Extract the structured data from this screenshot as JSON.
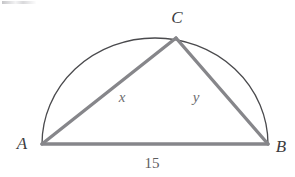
{
  "figure": {
    "kind": "geometry-diagram",
    "background_color": "#ffffff",
    "stroke_colors": {
      "arc": "#4a4a4d",
      "triangle": "#86868a",
      "label": "#58585a"
    },
    "arc": {
      "start": {
        "x": 42,
        "y": 144
      },
      "end": {
        "x": 268,
        "y": 144
      },
      "radius_x": 113,
      "radius_y": 106,
      "stroke_width": 1.3
    },
    "points": [
      {
        "id": "A",
        "x": 42,
        "y": 144
      },
      {
        "id": "B",
        "x": 268,
        "y": 144
      },
      {
        "id": "C",
        "x": 176,
        "y": 38
      }
    ],
    "segments": [
      {
        "id": "AC",
        "from": "A",
        "to": "C",
        "stroke_width": 3.4,
        "label": "x"
      },
      {
        "id": "CB",
        "from": "C",
        "to": "B",
        "stroke_width": 3.4,
        "label": "y"
      },
      {
        "id": "AB",
        "from": "A",
        "to": "B",
        "stroke_width": 3.4,
        "label": "15"
      }
    ],
    "labels": {
      "vertex_a": {
        "text": "A",
        "x": 22,
        "y": 143
      },
      "vertex_b": {
        "text": "B",
        "x": 281,
        "y": 146
      },
      "vertex_c": {
        "text": "C",
        "x": 177,
        "y": 17
      },
      "side_x": {
        "text": "x",
        "x": 122,
        "y": 97
      },
      "side_y": {
        "text": "y",
        "x": 196,
        "y": 97
      },
      "base_length": {
        "text": "15",
        "x": 152,
        "y": 163
      }
    }
  }
}
